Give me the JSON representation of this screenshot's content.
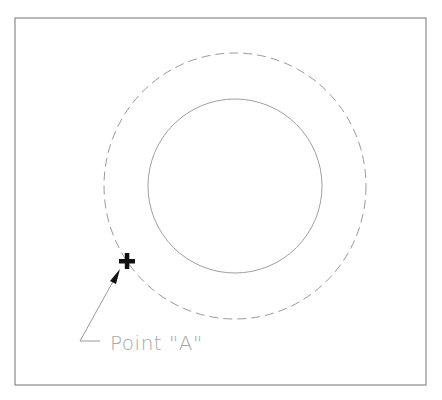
{
  "diagram": {
    "frame": {
      "x": 15,
      "y": 18,
      "width": 411,
      "height": 367,
      "stroke": "#8a8a8a"
    },
    "outer_circle": {
      "cx": 235,
      "cy": 186,
      "rx": 131,
      "ry": 133,
      "style": "dashed",
      "stroke": "#9a9a9a"
    },
    "inner_circle": {
      "cx": 235,
      "cy": 186,
      "r": 87,
      "style": "solid",
      "stroke": "#a0a0a0"
    },
    "point_marker": {
      "cx": 127,
      "cy": 261,
      "size": 16,
      "thickness": 4,
      "color": "#111111",
      "symbol": "cross"
    },
    "leader": {
      "landing": {
        "x1": 80,
        "y1": 341,
        "x2": 100,
        "y2": 341
      },
      "line": {
        "x1": 80,
        "y1": 341,
        "x2": 116,
        "y2": 276
      },
      "arrow_tip": {
        "x": 120,
        "y": 269
      },
      "stroke": "#9a9a9a"
    },
    "label": {
      "text": "Point \"A\"",
      "x": 110,
      "y": 350,
      "font_size": 20,
      "color": "#a8a8a8"
    }
  }
}
